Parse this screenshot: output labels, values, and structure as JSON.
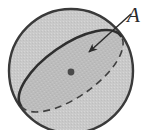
{
  "figure": {
    "type": "geometry-diagram",
    "canvas": {
      "width": 149,
      "height": 130,
      "background": "#ffffff"
    },
    "sphere": {
      "name": "sphere-outline",
      "center_x": 71,
      "center_y": 71,
      "radius": 62,
      "fill": "#c9c9c9",
      "stroke": "#3a3a3a",
      "stroke_width": 2.4
    },
    "cross_section": {
      "name": "great-circle-ellipse",
      "center_x": 71,
      "center_y": 71,
      "semi_major": 61,
      "semi_minor": 26,
      "rotation_deg": -35,
      "fill": "#bcbcbc",
      "solid_stroke": "#2f2f2f",
      "solid_stroke_width": 2.6,
      "dashed_stroke": "#3f3f3f",
      "dashed_stroke_width": 1.6,
      "dash_pattern": "7 5",
      "solid_half": "upper-left",
      "dashed_half": "lower-right"
    },
    "center_point": {
      "name": "sphere-center-dot",
      "x": 71,
      "y": 72,
      "radius": 3.4,
      "fill": "#4a4a4a"
    },
    "leader": {
      "name": "annotation-arrow",
      "from_x": 131,
      "from_y": 14,
      "to_x": 87,
      "to_y": 54,
      "stroke": "#2b2b2b",
      "stroke_width": 1.5,
      "arrowhead": "filled-triangle"
    },
    "label": {
      "name": "area-label",
      "text": "A",
      "style": "italic",
      "font_size_px": 21,
      "color": "#2b2b2b",
      "x": 127,
      "y": 5
    }
  }
}
